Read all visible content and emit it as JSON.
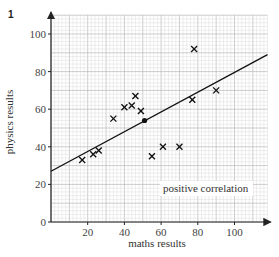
{
  "figure": {
    "question_number": "1"
  },
  "chart_data": {
    "type": "scatter",
    "title": "",
    "xlabel": "maths results",
    "ylabel": "physics results",
    "xlim": [
      0,
      118
    ],
    "ylim": [
      0,
      110
    ],
    "x_ticks": [
      20,
      40,
      60,
      80,
      100
    ],
    "y_ticks": [
      0,
      20,
      40,
      60,
      80,
      100
    ],
    "grid": true,
    "annotation": "positive correlation",
    "series": [
      {
        "name": "students",
        "marker": "x",
        "points": [
          {
            "x": 17,
            "y": 33
          },
          {
            "x": 23,
            "y": 36
          },
          {
            "x": 26,
            "y": 38
          },
          {
            "x": 34,
            "y": 55
          },
          {
            "x": 40,
            "y": 61
          },
          {
            "x": 44,
            "y": 62
          },
          {
            "x": 46,
            "y": 67
          },
          {
            "x": 49,
            "y": 59
          },
          {
            "x": 55,
            "y": 35
          },
          {
            "x": 61,
            "y": 40
          },
          {
            "x": 70,
            "y": 40
          },
          {
            "x": 77,
            "y": 65
          },
          {
            "x": 78,
            "y": 92
          },
          {
            "x": 90,
            "y": 70
          }
        ]
      }
    ],
    "mean_point": {
      "x": 51,
      "y": 54
    },
    "line_of_best_fit": {
      "x1": 0,
      "y1": 27,
      "x2": 118,
      "y2": 89
    }
  }
}
